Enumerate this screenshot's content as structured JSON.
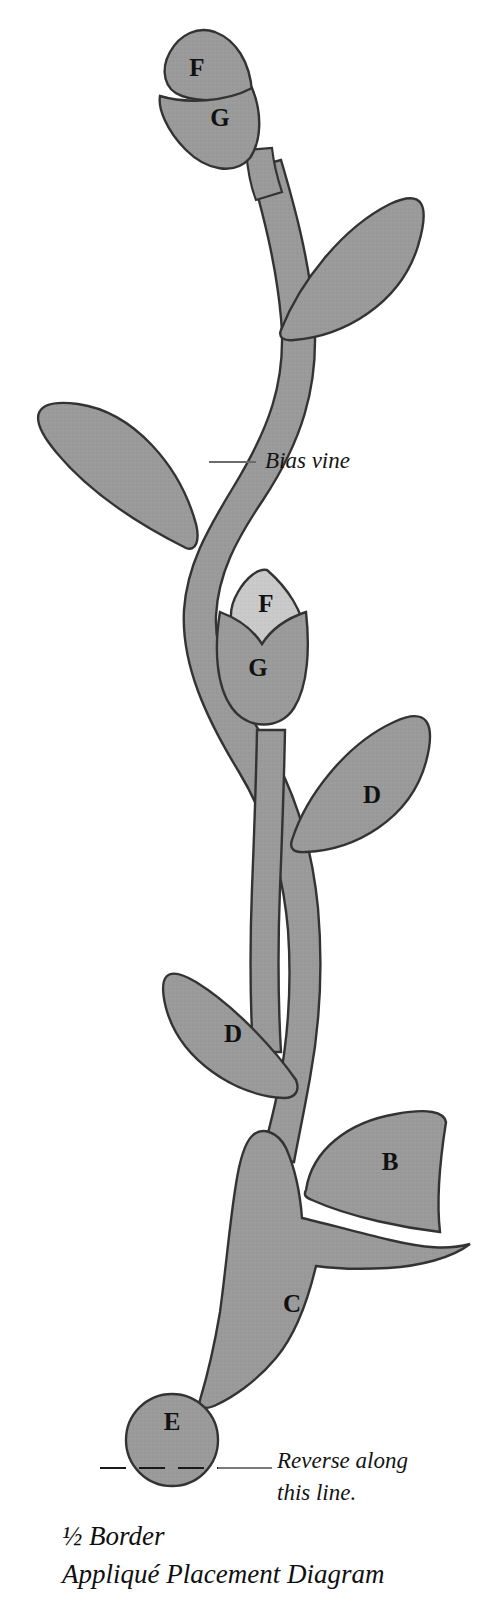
{
  "figure": {
    "title_lines": [
      "½ Border",
      "Appliqué Placement Diagram"
    ],
    "background_color": "#ffffff",
    "fill_main": "#9a9a9a",
    "fill_light": "#c9c9c9",
    "stroke_color": "#333333",
    "label_color": "#111111"
  },
  "annotations": [
    {
      "id": "bias-vine",
      "text": "Bias vine",
      "x": 265,
      "y": 462
    },
    {
      "id": "reverse-line-1",
      "text": "Reverse along",
      "x": 277,
      "y": 1462
    },
    {
      "id": "reverse-line-2",
      "text": "this line.",
      "x": 277,
      "y": 1494
    }
  ],
  "pieces": [
    {
      "id": "petal-f-top",
      "label": "F",
      "x": 197,
      "y": 70,
      "fill": "#a5a5a5"
    },
    {
      "id": "petal-g-top",
      "label": "G",
      "x": 220,
      "y": 117,
      "fill": "#9a9a9a"
    },
    {
      "id": "leaf-upper-right",
      "label": "",
      "x": 358,
      "y": 265,
      "fill": "#9a9a9a"
    },
    {
      "id": "leaf-mid-left",
      "label": "",
      "x": 105,
      "y": 470,
      "fill": "#9a9a9a"
    },
    {
      "id": "petal-f-mid",
      "label": "F",
      "x": 263,
      "y": 605,
      "fill": "#c9c9c9"
    },
    {
      "id": "petal-g-mid",
      "label": "G",
      "x": 257,
      "y": 669,
      "fill": "#9a9a9a"
    },
    {
      "id": "leaf-d-right",
      "label": "D",
      "x": 372,
      "y": 797,
      "fill": "#9a9a9a"
    },
    {
      "id": "leaf-d-left",
      "label": "D",
      "x": 233,
      "y": 1036,
      "fill": "#9a9a9a"
    },
    {
      "id": "petal-b",
      "label": "B",
      "x": 390,
      "y": 1163,
      "fill": "#9a9a9a"
    },
    {
      "id": "flower-c",
      "label": "C",
      "x": 293,
      "y": 1305,
      "fill": "#9a9a9a"
    },
    {
      "id": "circle-e",
      "label": "E",
      "x": 172,
      "y": 1440,
      "fill": "#9a9a9a"
    }
  ],
  "fold": {
    "dash_x_start": 100,
    "dash_x_end": 272,
    "y": 1468
  },
  "caption": {
    "line1": "½ Border",
    "line2": "Appliqué Placement Diagram",
    "x": 62,
    "y1": 1545,
    "y2": 1583
  }
}
